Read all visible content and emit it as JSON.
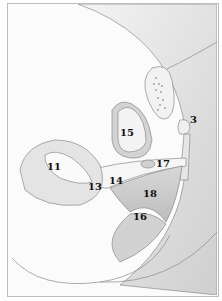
{
  "diagram": {
    "type": "anatomical cross-section illustration",
    "labels": [
      {
        "id": "3",
        "text": "3",
        "x": 192,
        "y": 118
      },
      {
        "id": "11",
        "text": "11",
        "x": 47,
        "y": 164
      },
      {
        "id": "13",
        "text": "13",
        "x": 88,
        "y": 182
      },
      {
        "id": "14",
        "text": "14",
        "x": 109,
        "y": 176
      },
      {
        "id": "15",
        "text": "15",
        "x": 120,
        "y": 128
      },
      {
        "id": "16",
        "text": "16",
        "x": 133,
        "y": 212
      },
      {
        "id": "17",
        "text": "17",
        "x": 156,
        "y": 159
      },
      {
        "id": "18",
        "text": "18",
        "x": 142,
        "y": 189
      }
    ],
    "colors": {
      "background": "#fbfbfb",
      "tissue_light": "#ececec",
      "tissue_mid": "#d6d6d6",
      "tissue_dark": "#bcbcbc",
      "outline": "#8a8a8a",
      "label": "#111111",
      "border": "#bdbdbd"
    }
  }
}
